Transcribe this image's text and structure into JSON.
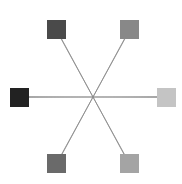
{
  "diagram": {
    "center": {
      "x": 93,
      "y": 97
    },
    "line_color": "#8a8a8a",
    "nodes": [
      {
        "id": "top-left",
        "x": 47,
        "y": 20,
        "size": 19,
        "color": "#4a4a4a"
      },
      {
        "id": "top-right",
        "x": 120,
        "y": 20,
        "size": 19,
        "color": "#888888"
      },
      {
        "id": "left",
        "x": 10,
        "y": 88,
        "size": 19,
        "color": "#222222"
      },
      {
        "id": "right",
        "x": 157,
        "y": 88,
        "size": 19,
        "color": "#c4c4c4"
      },
      {
        "id": "bottom-left",
        "x": 47,
        "y": 154,
        "size": 19,
        "color": "#6a6a6a"
      },
      {
        "id": "bottom-right",
        "x": 120,
        "y": 154,
        "size": 19,
        "color": "#a4a4a4"
      }
    ]
  }
}
